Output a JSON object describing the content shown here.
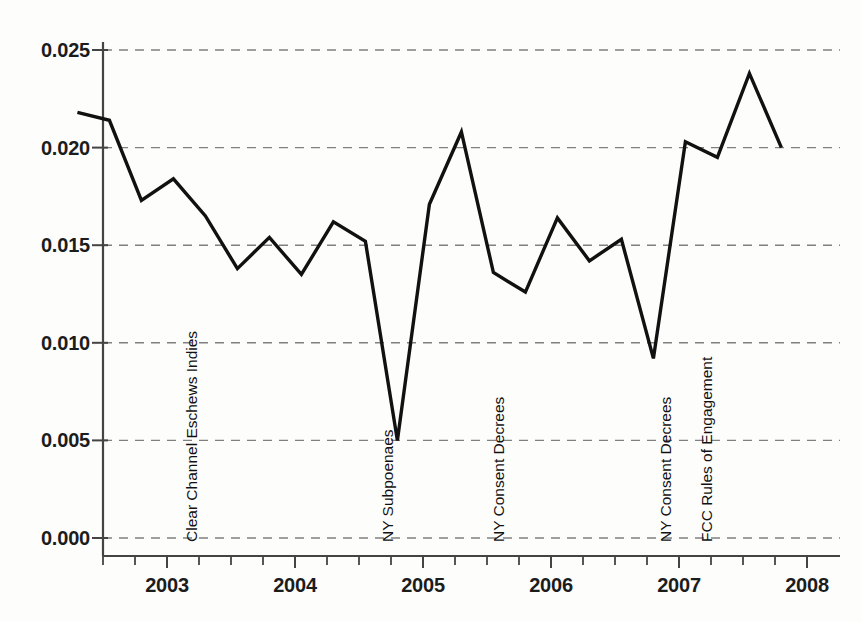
{
  "chart_data": {
    "type": "line",
    "title": "",
    "xlabel": "",
    "ylabel": "",
    "xlim": [
      2002.25,
      2008.0
    ],
    "ylim": [
      0.0,
      0.0265
    ],
    "grid": true,
    "legend": "none",
    "line_color": "#111111",
    "grid_color": "#808080",
    "axis_color": "#444444",
    "y_ticks": [
      "0.000",
      "0.005",
      "0.010",
      "0.015",
      "0.020",
      "0.025"
    ],
    "y_tick_values": [
      0.0,
      0.005,
      0.01,
      0.015,
      0.02,
      0.025
    ],
    "x_ticks": [
      "2003",
      "2004",
      "2005",
      "2006",
      "2007",
      "2008"
    ],
    "x_tick_values": [
      2003,
      2004,
      2005,
      2006,
      2007,
      2008
    ],
    "x_minor_ticks": [
      2002.5,
      2002.75,
      2003.25,
      2003.5,
      2003.75,
      2004.25,
      2004.5,
      2004.75,
      2005.25,
      2005.5,
      2005.75,
      2006.25,
      2006.5,
      2006.75,
      2007.25,
      2007.5,
      2007.75
    ],
    "x": [
      2002.3,
      2002.55,
      2002.8,
      2003.05,
      2003.3,
      2003.55,
      2003.8,
      2004.05,
      2004.3,
      2004.55,
      2004.8,
      2005.05,
      2005.3,
      2005.55,
      2005.8,
      2006.05,
      2006.3,
      2006.55,
      2006.8,
      2007.05,
      2007.3,
      2007.55,
      2007.8
    ],
    "values": [
      0.0218,
      0.0214,
      0.0173,
      0.0184,
      0.0165,
      0.0138,
      0.0154,
      0.0135,
      0.0162,
      0.0152,
      0.005,
      0.0171,
      0.0208,
      0.0136,
      0.0126,
      0.0164,
      0.0142,
      0.0153,
      0.0092,
      0.0203,
      0.0195,
      0.0238,
      0.02
    ],
    "annotations": [
      {
        "label": "Clear Channel Eschews Indies",
        "x": 2003.22
      },
      {
        "label": "NY Subpoenaes",
        "x": 2004.75
      },
      {
        "label": "NY Consent Decrees",
        "x": 2005.62
      },
      {
        "label": "NY Consent Decrees",
        "x": 2006.92
      },
      {
        "label": "FCC Rules of Engagement",
        "x": 2007.24
      }
    ]
  }
}
